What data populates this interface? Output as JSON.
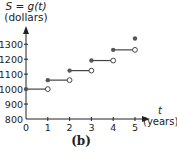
{
  "chart_data": {
    "type": "line",
    "subtype": "step",
    "title": "",
    "caption": "(b)",
    "ylabel_fn": "S = g(t)",
    "ylabel_unit": "(dollars)",
    "xlabel_var": "t",
    "xlabel_unit": "(years)",
    "xlim": [
      0,
      5.6
    ],
    "ylim": [
      800,
      1400
    ],
    "x_ticks": [
      "0",
      "1",
      "2",
      "3",
      "4",
      "5"
    ],
    "y_ticks": [
      "800",
      "900",
      "1000",
      "1100",
      "1200",
      "1300"
    ],
    "y_tick_values": [
      800,
      900,
      1000,
      1100,
      1200,
      1300
    ],
    "grid": false,
    "segments": [
      {
        "x_start": 0,
        "x_end": 1,
        "y": 1000,
        "start": "closed",
        "end": "open"
      },
      {
        "x_start": 1,
        "x_end": 2,
        "y": 1060,
        "start": "closed",
        "end": "open"
      },
      {
        "x_start": 2,
        "x_end": 3,
        "y": 1123.6,
        "start": "closed",
        "end": "open"
      },
      {
        "x_start": 3,
        "x_end": 4,
        "y": 1191.02,
        "start": "closed",
        "end": "open"
      },
      {
        "x_start": 4,
        "x_end": 5,
        "y": 1262.48,
        "start": "closed",
        "end": "open"
      },
      {
        "x_start": 5,
        "x_end": 5,
        "y": 1338.23,
        "start": "closed",
        "end": "none"
      }
    ]
  },
  "colors": {
    "axis": "#222222",
    "series": "#444444",
    "point_fill": "#555555"
  }
}
